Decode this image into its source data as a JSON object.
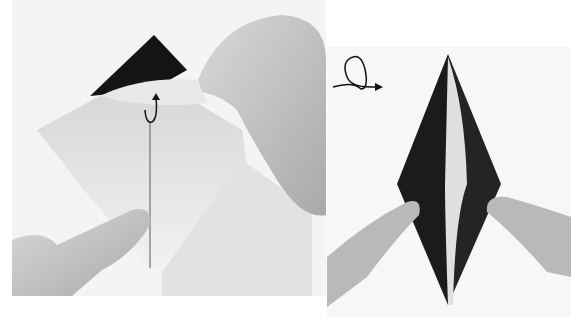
{
  "figure": {
    "panels": [
      {
        "id": "left",
        "description": "Hands lifting the top layer of a folded paper square along a vertical center crease; dark inner square visible at top",
        "symbols": [
          {
            "name": "lift-fold-arrow",
            "meaning": "lift up / unfold flap"
          }
        ]
      },
      {
        "id": "right",
        "description": "Elongated diamond (kite) shape with dark sides and white center strip, pressed flat by two fingers",
        "symbols": [
          {
            "name": "turn-over-symbol",
            "meaning": "turn model over"
          }
        ]
      }
    ],
    "colors": {
      "paper_dark": "#1a1a1a",
      "paper_light": "#e6e6e6",
      "skin": "#bdbdbd",
      "background": "#f4f4f4"
    }
  }
}
